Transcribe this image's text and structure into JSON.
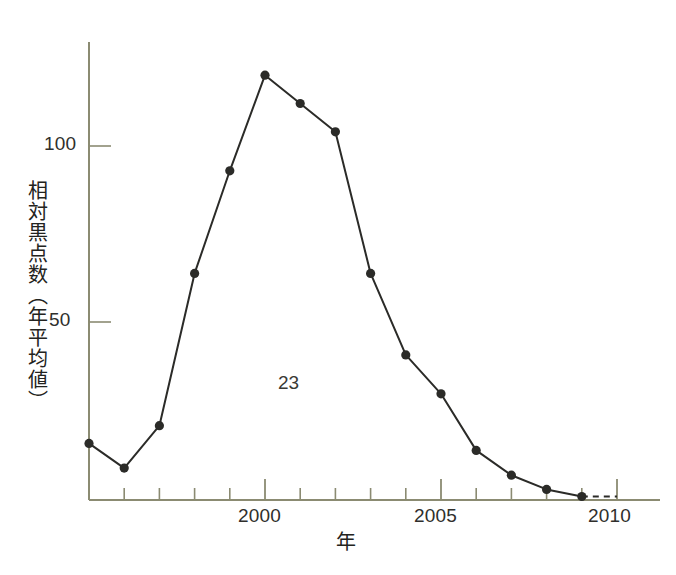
{
  "chart_data": {
    "type": "line",
    "title": "",
    "subtitle": "",
    "xlabel": "年",
    "ylabel": "相対黒点数（年平均値）",
    "x": [
      1995,
      1996,
      1997,
      1998,
      1999,
      2000,
      2001,
      2002,
      2003,
      2004,
      2005,
      2006,
      2007,
      2008,
      2009
    ],
    "values": [
      16,
      9,
      21,
      64,
      93,
      120,
      112,
      104,
      64,
      41,
      30,
      14,
      7,
      3,
      1
    ],
    "series": [
      {
        "name": "相対黒点数（年平均値）",
        "values": [
          16,
          9,
          21,
          64,
          93,
          120,
          112,
          104,
          64,
          41,
          30,
          14,
          7,
          3,
          1
        ]
      }
    ],
    "projection": {
      "style": "dashed",
      "x": [
        2009,
        2010
      ],
      "values": [
        1,
        1
      ]
    },
    "xlim": [
      1995,
      2010.5
    ],
    "ylim": [
      0,
      135
    ],
    "x_tick_labels": [
      "2000",
      "2005",
      "2010"
    ],
    "x_major_ticks": [
      2000,
      2005,
      2010
    ],
    "x_minor_tick_interval": 1,
    "y_tick_labels": [
      "50",
      "100"
    ],
    "y_major_ticks": [
      50,
      100
    ],
    "grid": false,
    "legend": "none",
    "annotations": [
      {
        "text": "23",
        "x": 2001,
        "y": 35,
        "meaning": "solar-cycle-number"
      }
    ],
    "marker": "filled-circle",
    "line_color": "#2b2b28",
    "marker_color": "#2b2b28",
    "axis_color": "#8a8a70",
    "background_color": "#ffffff"
  },
  "axes": {
    "y_title": "相対黒点数（年平均値）",
    "x_title": "年",
    "y_ticks": [
      {
        "label": "100",
        "value": 100
      },
      {
        "label": "50",
        "value": 50
      }
    ],
    "x_ticks": [
      {
        "label": "2000",
        "value": 2000
      },
      {
        "label": "2005",
        "value": 2005
      },
      {
        "label": "2010",
        "value": 2010
      }
    ]
  },
  "annotation": {
    "cycle_number": "23"
  }
}
